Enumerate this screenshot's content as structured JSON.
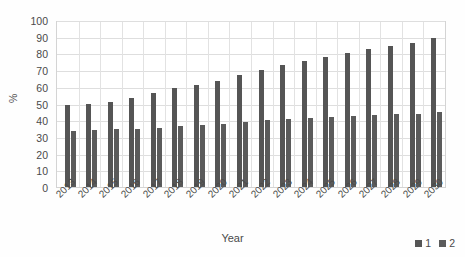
{
  "chart_data": {
    "type": "bar",
    "title": "",
    "xlabel": "Year",
    "ylabel": "%",
    "ylim": [
      0,
      100
    ],
    "ytick_step": 10,
    "yticks": [
      100,
      90,
      80,
      70,
      60,
      50,
      40,
      30,
      20,
      10,
      0
    ],
    "grid": true,
    "legend_position": "bottom-right",
    "categories": [
      "2013",
      "2014",
      "2015",
      "2016",
      "2017",
      "2018",
      "2019",
      "2020",
      "2021",
      "2022",
      "2023",
      "2024",
      "2025",
      "2026",
      "2027",
      "2028",
      "2029",
      "2030"
    ],
    "series": [
      {
        "name": "1",
        "color": "#555555",
        "values": [
          49,
          50,
          51,
          53.5,
          56.5,
          59,
          61,
          63.5,
          67,
          70,
          73,
          75.5,
          78,
          80.5,
          82.5,
          84.5,
          86.5,
          89
        ]
      },
      {
        "name": "2",
        "color": "#5b5b5b",
        "values": [
          33.5,
          34,
          34.5,
          35,
          35.5,
          36.5,
          37,
          38,
          39,
          40,
          41,
          41.5,
          42,
          42.5,
          43,
          43.5,
          44,
          45
        ]
      }
    ]
  },
  "axes": {
    "y_title": "%",
    "x_title": "Year"
  },
  "legend": {
    "items": [
      {
        "label": "1",
        "color": "#555555"
      },
      {
        "label": "2",
        "color": "#5b5b5b"
      }
    ]
  }
}
